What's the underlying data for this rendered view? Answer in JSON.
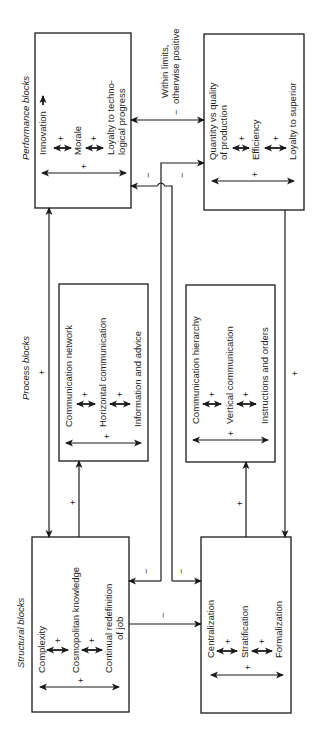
{
  "sections": {
    "performance": "Performance blocks",
    "process": "Process blocks",
    "structural": "Structural blocks"
  },
  "boxes": {
    "performance_left": {
      "items": [
        "Innovation",
        "Morale",
        "Loyalty to techno-",
        "logical progress"
      ],
      "signs": [
        "+",
        "+",
        "+"
      ]
    },
    "performance_right": {
      "items": [
        "Quantity vs quality",
        "of production",
        "Efficiency",
        "Loyalty to superior"
      ],
      "signs": [
        "+",
        "+",
        "+"
      ]
    },
    "process_left": {
      "items": [
        "Communication network",
        "Horizontal communication",
        "Information and advice"
      ],
      "signs": [
        "+",
        "+",
        "+"
      ]
    },
    "process_right": {
      "items": [
        "Communication hierarchy",
        "Vertical communication",
        "Instructions and orders"
      ],
      "signs": [
        "+",
        "+",
        "+"
      ]
    },
    "structural_left": {
      "items": [
        "Complexity",
        "Cosmopolitan knowledge",
        "Continual redefinition",
        "of job"
      ],
      "signs": [
        "+",
        "+",
        "+"
      ]
    },
    "structural_right": {
      "items": [
        "Centralization",
        "Stratification",
        "Formalization"
      ],
      "signs": [
        "+",
        "+",
        "+"
      ]
    }
  },
  "connections": {
    "performance_link_label_1": "Within limits,",
    "performance_link_label_2": "otherwise positive",
    "performance_link_sign": "−",
    "cross_top_left_sign": "−",
    "cross_top_right_sign": "−",
    "cross_bottom_left_sign": "−",
    "cross_bottom_right_sign": "−",
    "structural_link_sign": "−",
    "left_vertical_sign": "+",
    "right_vertical_sign": "+",
    "process_left_up_sign": "+",
    "process_right_up_sign": "+"
  }
}
